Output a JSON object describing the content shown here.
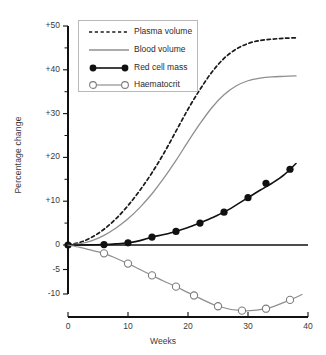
{
  "chart_data": {
    "type": "line",
    "title": "",
    "xlabel": "Weeks",
    "ylabel": "Percentage change",
    "xlim": [
      0,
      40
    ],
    "ylim": [
      -10,
      50
    ],
    "grid": false,
    "legend_position": "upper-left",
    "note": "Y axis uses a broken/dual scale: +50..0 compressed above the zero line, 0..-10 expanded below it.",
    "xticks": [
      "0",
      "10",
      "20",
      "30",
      "40"
    ],
    "xtick_values": [
      0,
      10,
      20,
      30,
      40
    ],
    "yticks": [
      "+50",
      "+40",
      "+30",
      "+20",
      "+10",
      "0",
      "-5",
      "-10"
    ],
    "ytick_values": [
      50,
      40,
      30,
      20,
      10,
      0,
      -5,
      -10
    ],
    "series": [
      {
        "name": "Plasma volume",
        "style": "dashed",
        "color": "#1a1a1a",
        "marker": "none",
        "x": [
          0,
          2,
          4,
          6,
          8,
          10,
          12,
          14,
          16,
          18,
          20,
          22,
          24,
          26,
          28,
          30,
          32,
          34,
          36,
          38
        ],
        "values": [
          0,
          0.6,
          1.8,
          3.6,
          6.0,
          9.0,
          12.5,
          16.5,
          21.0,
          26.0,
          31.0,
          35.5,
          39.5,
          42.6,
          44.7,
          46.0,
          46.7,
          47.0,
          47.2,
          47.3
        ]
      },
      {
        "name": "Blood volume",
        "style": "solid",
        "color": "#8f8f8f",
        "marker": "none",
        "x": [
          0,
          2,
          4,
          6,
          8,
          10,
          12,
          14,
          16,
          18,
          20,
          22,
          24,
          26,
          28,
          30,
          32,
          34,
          36,
          38
        ],
        "values": [
          0,
          0.3,
          1.0,
          2.2,
          3.9,
          6.0,
          8.6,
          11.7,
          15.3,
          19.3,
          23.6,
          27.7,
          31.4,
          34.3,
          36.3,
          37.5,
          38.1,
          38.4,
          38.5,
          38.6
        ]
      },
      {
        "name": "Red cell mass",
        "style": "solid",
        "color": "#111111",
        "marker": "filled-circle",
        "x": [
          0,
          6,
          10,
          14,
          18,
          22,
          26,
          30,
          33,
          37
        ],
        "values": [
          0,
          0.1,
          0.5,
          1.8,
          3.1,
          5.0,
          7.5,
          10.8,
          14.1,
          17.3
        ],
        "line_x": [
          0,
          2,
          4,
          6,
          8,
          10,
          12,
          14,
          16,
          18,
          20,
          22,
          24,
          26,
          28,
          30,
          32,
          34,
          36,
          38
        ],
        "line_values": [
          0,
          0.0,
          0.05,
          0.1,
          0.25,
          0.5,
          1.0,
          1.8,
          2.4,
          3.1,
          4.0,
          5.0,
          6.2,
          7.5,
          9.1,
          10.8,
          12.5,
          14.1,
          16.0,
          18.6
        ]
      },
      {
        "name": "Haematocrit",
        "style": "solid",
        "color": "#8f8f8f",
        "marker": "open-circle",
        "x": [
          0,
          6,
          10,
          14,
          18,
          21,
          25,
          29,
          33,
          37
        ],
        "values": [
          0,
          -1.7,
          -3.8,
          -6.2,
          -8.5,
          -10.3,
          -12.5,
          -13.4,
          -13.0,
          -11.2
        ],
        "line_x": [
          0,
          2,
          4,
          6,
          8,
          10,
          12,
          14,
          16,
          18,
          21,
          25,
          29,
          33,
          37,
          39
        ],
        "line_values": [
          0,
          -0.5,
          -1.1,
          -1.7,
          -2.7,
          -3.8,
          -5.0,
          -6.2,
          -7.4,
          -8.5,
          -10.3,
          -12.5,
          -13.4,
          -13.0,
          -11.2,
          -10.1
        ]
      }
    ]
  },
  "axes": {
    "y_axis_title": "Percentage change",
    "x_axis_title": "Weeks"
  },
  "legend": {
    "entries": [
      {
        "label": "Plasma volume",
        "swatch": "dashed-line"
      },
      {
        "label": "Blood volume",
        "swatch": "solid-gray-line"
      },
      {
        "label": "Red cell mass",
        "swatch": "solid-line-filled-circles"
      },
      {
        "label": "Haematocrit",
        "swatch": "solid-gray-line-open-circles"
      }
    ]
  },
  "colors": {
    "background": "#ffffff",
    "axis": "#111111",
    "gray_series": "#8f8f8f",
    "black_series": "#111111",
    "text": "#3a3a3a",
    "legend_border": "#b9b9b9"
  }
}
